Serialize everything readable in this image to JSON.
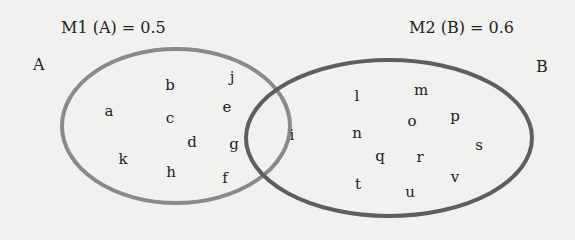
{
  "titles": {
    "m1": "M1 (A) = 0.5",
    "m2": "M2 (B) = 0.6"
  },
  "sets": {
    "A": {
      "label": "A",
      "color": "#8a8a8a",
      "cx": 176,
      "cy": 126,
      "rx": 114,
      "ry": 77
    },
    "B": {
      "label": "B",
      "color": "#5e5e5e",
      "cx": 389,
      "cy": 138,
      "rx": 143,
      "ry": 78
    }
  },
  "regions": {
    "A_only": [
      "a",
      "b",
      "c",
      "d",
      "e",
      "f",
      "g",
      "h",
      "j",
      "k"
    ],
    "A_and_B": [
      "i"
    ],
    "B_only": [
      "l",
      "m",
      "n",
      "o",
      "p",
      "q",
      "r",
      "s",
      "t",
      "u",
      "v"
    ]
  },
  "elements": [
    {
      "t": "a",
      "x": 109,
      "y": 111
    },
    {
      "t": "b",
      "x": 170,
      "y": 85
    },
    {
      "t": "j",
      "x": 232,
      "y": 77
    },
    {
      "t": "c",
      "x": 170,
      "y": 118
    },
    {
      "t": "e",
      "x": 227,
      "y": 107
    },
    {
      "t": "d",
      "x": 192,
      "y": 142
    },
    {
      "t": "g",
      "x": 234,
      "y": 144
    },
    {
      "t": "k",
      "x": 123,
      "y": 159
    },
    {
      "t": "h",
      "x": 171,
      "y": 172
    },
    {
      "t": "f",
      "x": 225,
      "y": 178
    },
    {
      "t": "i",
      "x": 292,
      "y": 135
    },
    {
      "t": "l",
      "x": 357,
      "y": 96
    },
    {
      "t": "m",
      "x": 421,
      "y": 90
    },
    {
      "t": "n",
      "x": 357,
      "y": 133
    },
    {
      "t": "o",
      "x": 412,
      "y": 121
    },
    {
      "t": "p",
      "x": 455,
      "y": 116
    },
    {
      "t": "q",
      "x": 380,
      "y": 156
    },
    {
      "t": "r",
      "x": 420,
      "y": 157
    },
    {
      "t": "s",
      "x": 479,
      "y": 145
    },
    {
      "t": "t",
      "x": 358,
      "y": 184
    },
    {
      "t": "u",
      "x": 410,
      "y": 192
    },
    {
      "t": "v",
      "x": 455,
      "y": 177
    }
  ]
}
